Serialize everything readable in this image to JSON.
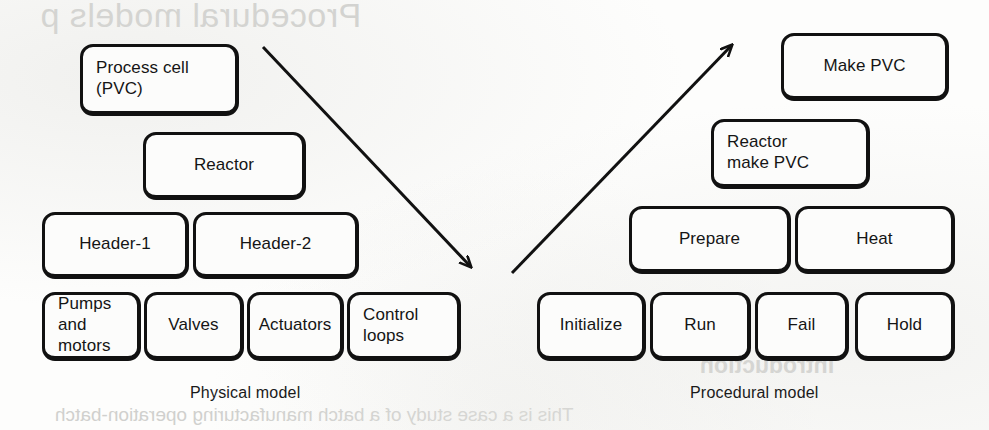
{
  "background_text": {
    "top_bleed": "Procedural models p",
    "mid_bleed": "Introduction",
    "bottom_bleed": "This is a case study of a batch manufacturing operation-batch"
  },
  "colors": {
    "node_stroke": "#111111",
    "node_fill": "#fcfcfb",
    "text": "#151515",
    "page_background": "#fdfdfc",
    "arrow": "#111111"
  },
  "physical_model": {
    "caption": "Physical model",
    "levels": [
      {
        "name": "process-cell-level",
        "nodes": [
          {
            "id": "process-cell",
            "label": "Process cell\n(PVC)",
            "align": "left",
            "x": 80,
            "y": 44,
            "w": 159,
            "h": 72
          }
        ]
      },
      {
        "name": "unit-level",
        "nodes": [
          {
            "id": "reactor",
            "label": "Reactor",
            "align": "center",
            "x": 143,
            "y": 132,
            "w": 163,
            "h": 68
          }
        ]
      },
      {
        "name": "equipment-module-level",
        "nodes": [
          {
            "id": "header-1",
            "label": "Header-1",
            "align": "center",
            "x": 42,
            "y": 212,
            "w": 147,
            "h": 67
          },
          {
            "id": "header-2",
            "label": "Header-2",
            "align": "center",
            "x": 193,
            "y": 212,
            "w": 166,
            "h": 67
          }
        ]
      },
      {
        "name": "control-module-level",
        "nodes": [
          {
            "id": "pumps-and-motors",
            "label": "Pumps\nand\nmotors",
            "align": "left",
            "x": 42,
            "y": 292,
            "w": 99,
            "h": 69
          },
          {
            "id": "valves",
            "label": "Valves",
            "align": "center",
            "x": 144,
            "y": 292,
            "w": 100,
            "h": 69
          },
          {
            "id": "actuators",
            "label": "Actuators",
            "align": "center",
            "x": 247,
            "y": 292,
            "w": 97,
            "h": 69
          },
          {
            "id": "control-loops",
            "label": "Control\nloops",
            "align": "left",
            "x": 347,
            "y": 292,
            "w": 114,
            "h": 69
          }
        ]
      }
    ]
  },
  "procedural_model": {
    "caption": "Procedural model",
    "levels": [
      {
        "name": "procedure-level",
        "nodes": [
          {
            "id": "make-pvc",
            "label": "Make PVC",
            "align": "center",
            "x": 781,
            "y": 33,
            "w": 168,
            "h": 68
          }
        ]
      },
      {
        "name": "unit-procedure-level",
        "nodes": [
          {
            "id": "reactor-make-pvc",
            "label": "Reactor\nmake PVC",
            "align": "left",
            "x": 711,
            "y": 119,
            "w": 159,
            "h": 70
          }
        ]
      },
      {
        "name": "operation-level",
        "nodes": [
          {
            "id": "prepare",
            "label": "Prepare",
            "align": "center",
            "x": 629,
            "y": 206,
            "w": 162,
            "h": 68
          },
          {
            "id": "heat",
            "label": "Heat",
            "align": "center",
            "x": 795,
            "y": 206,
            "w": 160,
            "h": 68
          }
        ]
      },
      {
        "name": "phase-level",
        "nodes": [
          {
            "id": "initialize",
            "label": "Initialize",
            "align": "center",
            "x": 537,
            "y": 292,
            "w": 109,
            "h": 69
          },
          {
            "id": "run",
            "label": "Run",
            "align": "center",
            "x": 650,
            "y": 292,
            "w": 101,
            "h": 69
          },
          {
            "id": "fail",
            "label": "Fail",
            "align": "center",
            "x": 755,
            "y": 292,
            "w": 94,
            "h": 69
          },
          {
            "id": "hold",
            "label": "Hold",
            "align": "center",
            "x": 855,
            "y": 292,
            "w": 100,
            "h": 69
          }
        ]
      }
    ]
  },
  "connectors": [
    {
      "id": "physical-to-procedural-down",
      "direction": "down-right",
      "from_x": 263,
      "from_y": 47,
      "to_x": 476,
      "to_y": 272
    },
    {
      "id": "procedural-to-physical-up",
      "direction": "up-right",
      "from_x": 512,
      "from_y": 273,
      "to_x": 736,
      "to_y": 41
    }
  ],
  "captions": {
    "physical": {
      "text": "Physical model",
      "x": 190,
      "y": 384
    },
    "procedural": {
      "text": "Procedural model",
      "x": 690,
      "y": 384
    }
  }
}
